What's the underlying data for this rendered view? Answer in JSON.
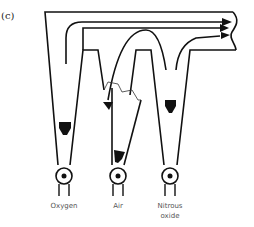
{
  "figure": {
    "panel_label": "(c)",
    "flowmeters": [
      {
        "label": "Oxygen",
        "label_lines": [
          "Oxygen"
        ],
        "cracked": false
      },
      {
        "label": "Air",
        "label_lines": [
          "Air"
        ],
        "cracked": true
      },
      {
        "label": "Nitrous oxide",
        "label_lines": [
          "Nitrous",
          "oxide"
        ],
        "cracked": false
      }
    ],
    "colors": {
      "stroke": "#111111",
      "text": "#555555",
      "background": "#ffffff"
    }
  }
}
